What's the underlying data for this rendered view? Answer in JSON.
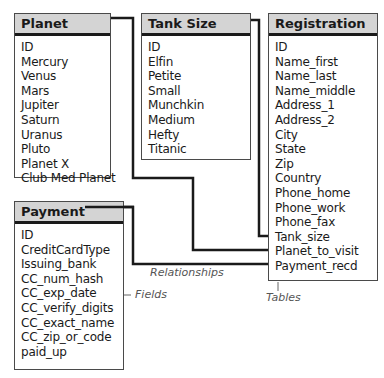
{
  "tables": {
    "planet": {
      "title": "Planet",
      "fields": [
        "ID",
        "Mercury",
        "Venus",
        "Mars",
        "Jupiter",
        "Saturn",
        "Uranus",
        "Pluto",
        "Planet X",
        "Club Med Planet"
      ]
    },
    "tank_size": {
      "title": "Tank Size",
      "fields": [
        "ID",
        "Elfin",
        "Petite",
        "Small",
        "Munchkin",
        "Medium",
        "Hefty",
        "Titanic"
      ]
    },
    "registration": {
      "title": "Registration",
      "fields": [
        "ID",
        "Name_first",
        "Name_last",
        "Name_middle",
        "Address_1",
        "Address_2",
        "City",
        "State",
        "Zip",
        "Country",
        "Phone_home",
        "Phone_work",
        "Phone_fax",
        "Tank_size",
        "Planet_to_visit",
        "Payment_recd"
      ]
    },
    "payment": {
      "title": "Payment",
      "fields": [
        "ID",
        "CreditCardType",
        "Issuing_bank",
        "CC_num_hash",
        "CC_exp_date",
        "CC_verify_digits",
        "CC_exact_name",
        "CC_zip_or_code",
        "paid_up"
      ]
    }
  },
  "relationships": [
    {
      "from": "Planet",
      "to": "Registration.Planet_to_visit"
    },
    {
      "from": "Tank Size",
      "to": "Registration.Tank_size"
    },
    {
      "from": "Payment",
      "to": "Registration.Payment_recd"
    }
  ],
  "annotations": {
    "relationships": "Relationships",
    "fields": "Fields",
    "tables": "Tables"
  },
  "colors": {
    "header_bg": "#d4d4d4",
    "line": "#1a1a1a",
    "annotation": "#555555"
  }
}
